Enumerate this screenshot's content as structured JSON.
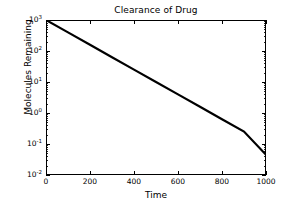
{
  "chart_data": {
    "type": "line",
    "title": "Clearance of Drug",
    "xlabel": "Time",
    "ylabel": "Molecules Remaining",
    "xscale": "linear",
    "yscale": "log",
    "xlim": [
      0,
      1000
    ],
    "ylim": [
      0.01,
      1000
    ],
    "grid": false,
    "legend": null,
    "xticks": [
      0,
      200,
      400,
      600,
      800,
      1000
    ],
    "xticklabels": [
      "0",
      "200",
      "400",
      "600",
      "800",
      "1000"
    ],
    "yticks": [
      0.01,
      0.1,
      1,
      10,
      100,
      1000
    ],
    "yticklabels": [
      "10⁻²",
      "10⁻¹",
      "10⁰",
      "10¹",
      "10²",
      "10³"
    ],
    "yticklabel_parts": [
      {
        "base": "10",
        "exp": "-2"
      },
      {
        "base": "10",
        "exp": "-1"
      },
      {
        "base": "10",
        "exp": "0"
      },
      {
        "base": "10",
        "exp": "1"
      },
      {
        "base": "10",
        "exp": "2"
      },
      {
        "base": "10",
        "exp": "3"
      }
    ],
    "series": [
      {
        "name": "Molecules Remaining",
        "color": "#000000",
        "linewidth": 2,
        "x": [
          0,
          100,
          200,
          300,
          400,
          500,
          600,
          700,
          800,
          900,
          1000
        ],
        "values": [
          1000,
          398.1,
          158.5,
          63.1,
          25.1,
          10.0,
          3.98,
          1.585,
          0.631,
          0.251,
          0.0447
        ]
      }
    ],
    "annotations": []
  },
  "figure": {
    "background": "#ffffff",
    "axis_color": "#000000",
    "text_color": "#000000"
  }
}
